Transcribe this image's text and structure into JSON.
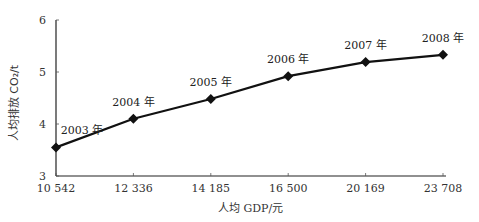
{
  "chart_data": {
    "type": "line",
    "title": "",
    "xlabel": "人均 GDP/元",
    "ylabel": "人均排放 CO₂/t",
    "categories": [
      "10 542",
      "12 336",
      "14 185",
      "16 500",
      "20 169",
      "23 708"
    ],
    "series": [
      {
        "name": "人均排放 CO₂",
        "values": [
          3.55,
          4.1,
          4.48,
          4.92,
          5.19,
          5.33
        ],
        "point_labels": [
          "2003 年",
          "2004 年",
          "2005 年",
          "2006 年",
          "2007 年",
          "2008 年"
        ],
        "marker": "diamond",
        "color": "#111111"
      }
    ],
    "yticks": [
      3,
      4,
      5,
      6
    ],
    "ylim": [
      3,
      6
    ],
    "grid": false,
    "legend": "none"
  },
  "axes": {
    "xlabel": "人均 GDP/元",
    "ylabel": "人均排放 CO₂/t"
  }
}
